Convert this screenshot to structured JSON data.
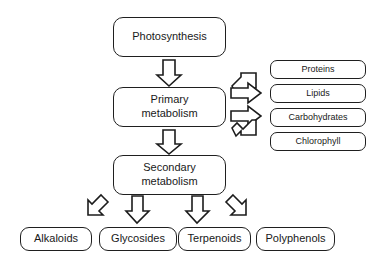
{
  "diagram": {
    "background_color": "#ffffff",
    "outline_color": "#1f1f1f",
    "text_color": "#191919",
    "nodes": {
      "photosynthesis": "Photosynthesis",
      "primary_metabolism": "Primary\nmetabolism",
      "secondary_metabolism": "Secondary\nmetabolism",
      "proteins": "Proteins",
      "lipids": "Lipids",
      "carbohydrates": "Carbohydrates",
      "chlorophyll": "Chlorophyll",
      "alkaloids": "Alkaloids",
      "glycosides": "Glycosides",
      "terpenoids": "Terpenoids",
      "polyphenols": "Polyphenols"
    },
    "arrows": [
      {
        "name": "photosynthesis-to-primary",
        "direction": "down",
        "from": "photosynthesis",
        "to": "primary_metabolism"
      },
      {
        "name": "primary-to-secondary",
        "direction": "down",
        "from": "primary_metabolism",
        "to": "secondary_metabolism"
      },
      {
        "name": "primary-to-proteins",
        "direction": "up-right",
        "from": "primary_metabolism",
        "to": "proteins"
      },
      {
        "name": "primary-to-lipids",
        "direction": "right",
        "from": "primary_metabolism",
        "to": "lipids"
      },
      {
        "name": "primary-to-carbohydrates",
        "direction": "right",
        "from": "primary_metabolism",
        "to": "carbohydrates"
      },
      {
        "name": "primary-to-chlorophyll",
        "direction": "down-right",
        "from": "primary_metabolism",
        "to": "chlorophyll"
      },
      {
        "name": "secondary-to-alkaloids",
        "direction": "down-left",
        "from": "secondary_metabolism",
        "to": "alkaloids"
      },
      {
        "name": "secondary-to-glycosides",
        "direction": "down",
        "from": "secondary_metabolism",
        "to": "glycosides"
      },
      {
        "name": "secondary-to-terpenoids",
        "direction": "down",
        "from": "secondary_metabolism",
        "to": "terpenoids"
      },
      {
        "name": "secondary-to-polyphenols",
        "direction": "down-right",
        "from": "secondary_metabolism",
        "to": "polyphenols"
      }
    ]
  }
}
